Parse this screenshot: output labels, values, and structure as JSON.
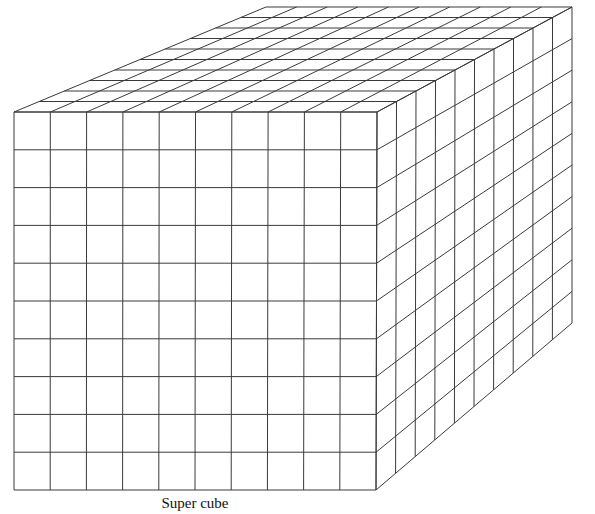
{
  "figure": {
    "caption": "Super cube",
    "stroke_color": "#3a3a3a",
    "background": "#ffffff"
  },
  "cube": {
    "grid_divisions": 10,
    "faces": {
      "front": {
        "top_left": [
          14,
          112
        ],
        "top_right": [
          377,
          112
        ],
        "bottom_right": [
          376,
          490
        ],
        "bottom_left": [
          14,
          490
        ]
      },
      "top": {
        "front_left": [
          14,
          112
        ],
        "front_right": [
          377,
          112
        ],
        "back_right": [
          572,
          7
        ],
        "back_left": [
          266,
          7
        ]
      },
      "right": {
        "front_top": [
          377,
          112
        ],
        "back_top": [
          572,
          7
        ],
        "back_bottom": [
          572,
          323
        ],
        "front_bottom": [
          376,
          490
        ]
      }
    }
  }
}
